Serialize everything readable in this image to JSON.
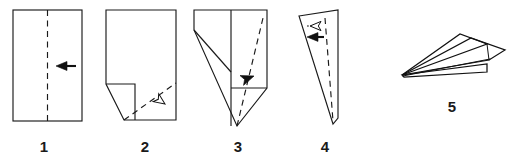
{
  "illustration": {
    "title": "Paper airplane folding instructions",
    "type": "origami-step-diagram",
    "background_color": "#ffffff",
    "ink_color": "#1a1a1a",
    "step_count": 5
  },
  "steps": [
    {
      "number": "1",
      "label_x": 44,
      "label_y": 152,
      "shape": "upright rectangle sheet of paper",
      "fold_line": "vertical dashed center line",
      "arrow": {
        "kind": "solid-arrow",
        "direction": "left",
        "meaning": "fold in half toward the center line"
      }
    },
    {
      "number": "2",
      "label_x": 145,
      "label_y": 152,
      "shape": "rectangle with lower-left corner folded down to the bottom edge",
      "fold_line": "diagonal dashed line from bottom-left of the body to the right edge",
      "arrow": {
        "kind": "hollow-arrow",
        "direction": "up-left",
        "meaning": "fold the lower-right corner up along the dashed line"
      }
    },
    {
      "number": "3",
      "label_x": 238,
      "label_y": 152,
      "shape": "sheet with both lower corners folded into a point at the bottom",
      "fold_line": "diagonal dashed line from bottom point to upper right corner",
      "arrow": {
        "kind": "solid-arrow",
        "direction": "down-left",
        "meaning": "fold the right flap across"
      }
    },
    {
      "number": "4",
      "label_x": 325,
      "label_y": 152,
      "shape": "narrow elongated triangle, folded body",
      "fold_line": "vertical dashed line near the right edge",
      "arrows": [
        {
          "kind": "hollow-arrow",
          "direction": "left",
          "meaning": "fold wing down"
        },
        {
          "kind": "solid-arrow",
          "direction": "left",
          "meaning": "repeat behind"
        }
      ]
    },
    {
      "number": "5",
      "label_x": 452,
      "label_y": 112,
      "shape": "finished paper airplane seen from the side",
      "fold_line": "none",
      "arrow": null
    }
  ],
  "labels": {
    "step1": "1",
    "step2": "2",
    "step3": "3",
    "step4": "4",
    "step5": "5"
  }
}
